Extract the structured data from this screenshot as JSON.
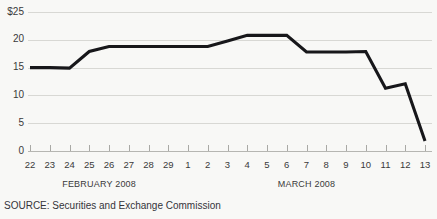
{
  "chart_data": {
    "type": "line",
    "title": "",
    "xlabel": "",
    "ylabel": "",
    "ylim": [
      0,
      25
    ],
    "yticks": [
      0,
      5,
      10,
      15,
      20,
      25
    ],
    "ytick_labels": [
      "0",
      "5",
      "10",
      "15",
      "20",
      "$25"
    ],
    "grid": true,
    "legend": null,
    "currency_prefix": "$",
    "categories": [
      "22",
      "23",
      "24",
      "25",
      "26",
      "27",
      "28",
      "29",
      "1",
      "2",
      "3",
      "4",
      "5",
      "6",
      "7",
      "8",
      "9",
      "10",
      "11",
      "12",
      "13"
    ],
    "values": [
      15.0,
      15.0,
      14.9,
      17.9,
      18.8,
      18.8,
      18.8,
      18.8,
      18.8,
      18.8,
      19.8,
      20.8,
      20.8,
      20.8,
      17.8,
      17.8,
      17.8,
      17.9,
      11.3,
      12.1,
      1.8
    ],
    "series": [
      {
        "name": "Share price",
        "color": "#17171a",
        "values": [
          15.0,
          15.0,
          14.9,
          17.9,
          18.8,
          18.8,
          18.8,
          18.8,
          18.8,
          18.8,
          19.8,
          20.8,
          20.8,
          20.8,
          17.8,
          17.8,
          17.8,
          17.9,
          11.3,
          12.1,
          1.8
        ]
      }
    ],
    "group_labels": [
      {
        "text": "FEBRUARY 2008",
        "start_index": 0,
        "end_index": 7
      },
      {
        "text": "MARCH 2008",
        "start_index": 8,
        "end_index": 20
      }
    ],
    "annotations": []
  },
  "footer": {
    "source": "SOURCE: Securities and Exchange Commission"
  },
  "colors": {
    "background": "#f8f8f6",
    "line": "#17171a",
    "gridline": "#d8d8d4",
    "axis": "#b6b6b2",
    "text": "#3a3a3a"
  }
}
